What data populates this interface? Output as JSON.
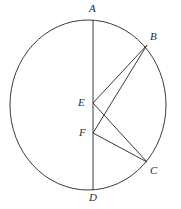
{
  "figure": {
    "kind": "geometry-diagram",
    "background_color": "#ffffff",
    "stroke_color": "#3a3a3a",
    "label_color": "#2b2b2b",
    "canvas": {
      "width": 181,
      "height": 209
    }
  },
  "circle": {
    "name": "main-circle",
    "center_x": 88,
    "center_y": 105,
    "radius_x": 78,
    "radius_y": 85,
    "stroke_width": 1
  },
  "points": [
    {
      "id": "A",
      "label": "A",
      "x": 93,
      "y": 20,
      "label_x": 89,
      "label_y": 3
    },
    {
      "id": "B",
      "label": "B",
      "x": 147,
      "y": 45,
      "label_x": 150,
      "label_y": 31
    },
    {
      "id": "C",
      "label": "C",
      "x": 147,
      "y": 162,
      "label_x": 150,
      "label_y": 165
    },
    {
      "id": "D",
      "label": "D",
      "x": 93,
      "y": 190,
      "label_x": 89,
      "label_y": 192
    },
    {
      "id": "E",
      "label": "E",
      "x": 93,
      "y": 103,
      "label_x": 78,
      "label_y": 97
    },
    {
      "id": "F",
      "label": "F",
      "x": 93,
      "y": 133,
      "label_x": 79,
      "label_y": 127
    }
  ],
  "segments": [
    {
      "id": "AD",
      "from": "A",
      "to": "D",
      "x1": 93,
      "y1": 20,
      "x2": 93,
      "y2": 190
    },
    {
      "id": "EB",
      "from": "E",
      "to": "B",
      "x1": 93,
      "y1": 103,
      "x2": 147,
      "y2": 45
    },
    {
      "id": "EC",
      "from": "E",
      "to": "C",
      "x1": 93,
      "y1": 103,
      "x2": 147,
      "y2": 162
    },
    {
      "id": "FB",
      "from": "F",
      "to": "B",
      "x1": 93,
      "y1": 133,
      "x2": 147,
      "y2": 45
    },
    {
      "id": "FC",
      "from": "F",
      "to": "C",
      "x1": 93,
      "y1": 133,
      "x2": 147,
      "y2": 162
    }
  ]
}
